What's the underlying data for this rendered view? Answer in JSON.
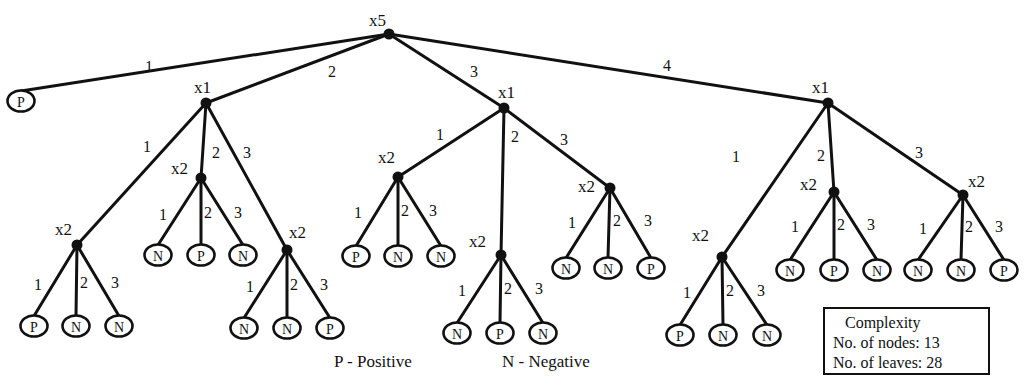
{
  "figure": {
    "type": "decision-tree",
    "legend": {
      "positive": "P - Positive",
      "negative": "N - Negative"
    },
    "complexity_box": {
      "title": "Complexity",
      "nodes_line": "No. of nodes: 13",
      "leaves_line": "No. of leaves: 28"
    },
    "colors": {
      "ink": "#111111",
      "background": "#ffffff"
    }
  },
  "tree": {
    "nodes": [
      {
        "id": "root",
        "label": "x5",
        "x": 389,
        "y": 34,
        "lx": -20,
        "ly": -8
      },
      {
        "id": "n1",
        "label": "x1",
        "x": 206,
        "y": 103,
        "lx": -12,
        "ly": -10
      },
      {
        "id": "n2",
        "label": "x1",
        "x": 504,
        "y": 108,
        "lx": -6,
        "ly": -10
      },
      {
        "id": "n3",
        "label": "x1",
        "x": 828,
        "y": 103,
        "lx": -16,
        "ly": -10
      },
      {
        "id": "n11",
        "label": "x2",
        "x": 77,
        "y": 245,
        "lx": -22,
        "ly": -10
      },
      {
        "id": "n12",
        "label": "x2",
        "x": 201,
        "y": 178,
        "lx": -30,
        "ly": -4
      },
      {
        "id": "n13",
        "label": "x2",
        "x": 287,
        "y": 250,
        "lx": 2,
        "ly": -12
      },
      {
        "id": "n21",
        "label": "x2",
        "x": 398,
        "y": 177,
        "lx": -20,
        "ly": -14
      },
      {
        "id": "n22",
        "label": "x2",
        "x": 501,
        "y": 255,
        "lx": -32,
        "ly": -8
      },
      {
        "id": "n23",
        "label": "x2",
        "x": 610,
        "y": 188,
        "lx": -32,
        "ly": 4
      },
      {
        "id": "n31",
        "label": "x2",
        "x": 722,
        "y": 257,
        "lx": -30,
        "ly": -16
      },
      {
        "id": "n32",
        "label": "x2",
        "x": 834,
        "y": 192,
        "lx": -34,
        "ly": -2
      },
      {
        "id": "n33",
        "label": "x2",
        "x": 963,
        "y": 195,
        "lx": 5,
        "ly": -8
      }
    ],
    "leaves": [
      {
        "id": "l0",
        "label": "P",
        "x": 21,
        "y": 101
      },
      {
        "id": "l111",
        "label": "P",
        "x": 34,
        "y": 326
      },
      {
        "id": "l112",
        "label": "N",
        "x": 76,
        "y": 326
      },
      {
        "id": "l113",
        "label": "N",
        "x": 119,
        "y": 326
      },
      {
        "id": "l121",
        "label": "N",
        "x": 158,
        "y": 255
      },
      {
        "id": "l122",
        "label": "P",
        "x": 201,
        "y": 255
      },
      {
        "id": "l123",
        "label": "N",
        "x": 243,
        "y": 255
      },
      {
        "id": "l131",
        "label": "N",
        "x": 244,
        "y": 328
      },
      {
        "id": "l132",
        "label": "N",
        "x": 287,
        "y": 328
      },
      {
        "id": "l133",
        "label": "P",
        "x": 330,
        "y": 328
      },
      {
        "id": "l211",
        "label": "P",
        "x": 356,
        "y": 256
      },
      {
        "id": "l212",
        "label": "N",
        "x": 398,
        "y": 256
      },
      {
        "id": "l213",
        "label": "N",
        "x": 441,
        "y": 256
      },
      {
        "id": "l221",
        "label": "N",
        "x": 457,
        "y": 333
      },
      {
        "id": "l222",
        "label": "P",
        "x": 500,
        "y": 333
      },
      {
        "id": "l223",
        "label": "N",
        "x": 543,
        "y": 333
      },
      {
        "id": "l231",
        "label": "N",
        "x": 566,
        "y": 268
      },
      {
        "id": "l232",
        "label": "N",
        "x": 608,
        "y": 268
      },
      {
        "id": "l233",
        "label": "P",
        "x": 651,
        "y": 268
      },
      {
        "id": "l311",
        "label": "P",
        "x": 680,
        "y": 335
      },
      {
        "id": "l312",
        "label": "N",
        "x": 723,
        "y": 335
      },
      {
        "id": "l313",
        "label": "N",
        "x": 767,
        "y": 335
      },
      {
        "id": "l321",
        "label": "N",
        "x": 790,
        "y": 270
      },
      {
        "id": "l322",
        "label": "P",
        "x": 834,
        "y": 270
      },
      {
        "id": "l323",
        "label": "N",
        "x": 877,
        "y": 270
      },
      {
        "id": "l331",
        "label": "N",
        "x": 918,
        "y": 270
      },
      {
        "id": "l332",
        "label": "N",
        "x": 961,
        "y": 270
      },
      {
        "id": "l333",
        "label": "P",
        "x": 1004,
        "y": 270
      }
    ],
    "edges": [
      {
        "from": "root",
        "to": "l0",
        "label": "1",
        "lx": 145,
        "ly": 72
      },
      {
        "from": "root",
        "to": "n1",
        "label": "2",
        "lx": 328,
        "ly": 77
      },
      {
        "from": "root",
        "to": "n2",
        "label": "3",
        "lx": 470,
        "ly": 77
      },
      {
        "from": "root",
        "to": "n3",
        "label": "4",
        "lx": 663,
        "ly": 71
      },
      {
        "from": "n1",
        "to": "n11",
        "label": "1",
        "lx": 143,
        "ly": 152
      },
      {
        "from": "n1",
        "to": "n12",
        "label": "2",
        "lx": 212,
        "ly": 158
      },
      {
        "from": "n1",
        "to": "n13",
        "label": "3",
        "lx": 243,
        "ly": 158
      },
      {
        "from": "n11",
        "to": "l111",
        "label": "1",
        "lx": 34,
        "ly": 290
      },
      {
        "from": "n11",
        "to": "l112",
        "label": "2",
        "lx": 80,
        "ly": 288
      },
      {
        "from": "n11",
        "to": "l113",
        "label": "3",
        "lx": 111,
        "ly": 288
      },
      {
        "from": "n12",
        "to": "l121",
        "label": "1",
        "lx": 159,
        "ly": 220
      },
      {
        "from": "n12",
        "to": "l122",
        "label": "2",
        "lx": 204,
        "ly": 218
      },
      {
        "from": "n12",
        "to": "l123",
        "label": "3",
        "lx": 234,
        "ly": 218
      },
      {
        "from": "n13",
        "to": "l131",
        "label": "1",
        "lx": 246,
        "ly": 292
      },
      {
        "from": "n13",
        "to": "l132",
        "label": "2",
        "lx": 290,
        "ly": 290
      },
      {
        "from": "n13",
        "to": "l133",
        "label": "3",
        "lx": 320,
        "ly": 290
      },
      {
        "from": "n2",
        "to": "n21",
        "label": "1",
        "lx": 436,
        "ly": 140
      },
      {
        "from": "n2",
        "to": "n22",
        "label": "2",
        "lx": 511,
        "ly": 142
      },
      {
        "from": "n2",
        "to": "n23",
        "label": "3",
        "lx": 560,
        "ly": 145
      },
      {
        "from": "n21",
        "to": "l211",
        "label": "1",
        "lx": 354,
        "ly": 218
      },
      {
        "from": "n21",
        "to": "l212",
        "label": "2",
        "lx": 401,
        "ly": 216
      },
      {
        "from": "n21",
        "to": "l213",
        "label": "3",
        "lx": 429,
        "ly": 216
      },
      {
        "from": "n22",
        "to": "l221",
        "label": "1",
        "lx": 458,
        "ly": 296
      },
      {
        "from": "n22",
        "to": "l222",
        "label": "2",
        "lx": 504,
        "ly": 294
      },
      {
        "from": "n22",
        "to": "l223",
        "label": "3",
        "lx": 535,
        "ly": 294
      },
      {
        "from": "n23",
        "to": "l231",
        "label": "1",
        "lx": 568,
        "ly": 228
      },
      {
        "from": "n23",
        "to": "l232",
        "label": "2",
        "lx": 613,
        "ly": 226
      },
      {
        "from": "n23",
        "to": "l233",
        "label": "3",
        "lx": 644,
        "ly": 226
      },
      {
        "from": "n3",
        "to": "n31",
        "label": "1",
        "lx": 732,
        "ly": 162
      },
      {
        "from": "n3",
        "to": "n32",
        "label": "2",
        "lx": 817,
        "ly": 161
      },
      {
        "from": "n3",
        "to": "n33",
        "label": "3",
        "lx": 915,
        "ly": 158
      },
      {
        "from": "n31",
        "to": "l311",
        "label": "1",
        "lx": 683,
        "ly": 298
      },
      {
        "from": "n31",
        "to": "l312",
        "label": "2",
        "lx": 726,
        "ly": 296
      },
      {
        "from": "n31",
        "to": "l313",
        "label": "3",
        "lx": 757,
        "ly": 296
      },
      {
        "from": "n32",
        "to": "l321",
        "label": "1",
        "lx": 791,
        "ly": 232
      },
      {
        "from": "n32",
        "to": "l322",
        "label": "2",
        "lx": 837,
        "ly": 230
      },
      {
        "from": "n32",
        "to": "l323",
        "label": "3",
        "lx": 867,
        "ly": 230
      },
      {
        "from": "n33",
        "to": "l331",
        "label": "1",
        "lx": 919,
        "ly": 234
      },
      {
        "from": "n33",
        "to": "l332",
        "label": "2",
        "lx": 965,
        "ly": 232
      },
      {
        "from": "n33",
        "to": "l333",
        "label": "3",
        "lx": 995,
        "ly": 232
      }
    ]
  }
}
